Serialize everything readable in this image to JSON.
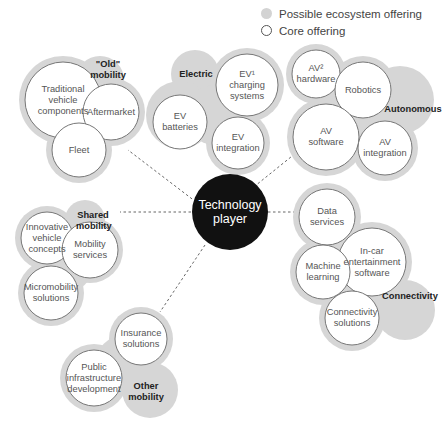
{
  "legend": {
    "ecosystem_label": "Possible ecosystem offering",
    "core_label": "Core offering",
    "ecosystem_color": "#d3d3d3"
  },
  "center": {
    "label_line1": "Technology",
    "label_line2": "player",
    "color": "#111111"
  },
  "groups": [
    {
      "id": "old-mobility",
      "label_line1": "\"Old\"",
      "label_line2": "mobility",
      "offerings": [
        {
          "lines": [
            "Traditional",
            "vehicle",
            "components"
          ]
        },
        {
          "lines": [
            "Aftermarket"
          ]
        },
        {
          "lines": [
            "Fleet"
          ]
        }
      ]
    },
    {
      "id": "electric",
      "label_line1": "Electric",
      "offerings": [
        {
          "lines": [
            "EV¹",
            "charging",
            "systems"
          ]
        },
        {
          "lines": [
            "EV",
            "batteries"
          ]
        },
        {
          "lines": [
            "EV",
            "integration"
          ]
        }
      ]
    },
    {
      "id": "autonomous",
      "label_line1": "Autonomous",
      "offerings": [
        {
          "lines": [
            "AV²",
            "hardware"
          ]
        },
        {
          "lines": [
            "Robotics"
          ]
        },
        {
          "lines": [
            "AV",
            "software"
          ]
        },
        {
          "lines": [
            "AV",
            "integration"
          ]
        }
      ]
    },
    {
      "id": "shared-mobility",
      "label_line1": "Shared",
      "label_line2": "mobility",
      "offerings": [
        {
          "lines": [
            "Innovative",
            "vehicle",
            "concepts"
          ]
        },
        {
          "lines": [
            "Mobility",
            "services"
          ]
        },
        {
          "lines": [
            "Micromobility",
            "solutions"
          ]
        }
      ]
    },
    {
      "id": "connectivity",
      "label_line1": "Connectivity",
      "offerings": [
        {
          "lines": [
            "Data",
            "services"
          ]
        },
        {
          "lines": [
            "In-car",
            "entertainment",
            "software"
          ]
        },
        {
          "lines": [
            "Machine",
            "learning"
          ]
        },
        {
          "lines": [
            "Connectivity",
            "solutions"
          ]
        }
      ]
    },
    {
      "id": "other-mobility",
      "label_line1": "Other",
      "label_line2": "mobility",
      "offerings": [
        {
          "lines": [
            "Insurance",
            "solutions"
          ]
        },
        {
          "lines": [
            "Public",
            "infrastructure",
            "development"
          ]
        }
      ]
    }
  ]
}
